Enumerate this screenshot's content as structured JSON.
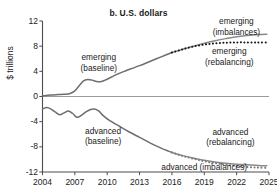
{
  "chart_data": {
    "type": "line",
    "title": "b. U.S. dollars",
    "xlabel": "",
    "ylabel": "$ trillions",
    "xlim": [
      2004,
      2025
    ],
    "ylim": [
      -12,
      12
    ],
    "grid": false,
    "legend_position": "inline-annotations",
    "xticks": [
      "2004",
      "2007",
      "2010",
      "2013",
      "2016",
      "2019",
      "2022",
      "2025"
    ],
    "xtick_values": [
      2004,
      2007,
      2010,
      2013,
      2016,
      2019,
      2022,
      2025
    ],
    "yticks": [
      "12",
      "8",
      "4",
      "0",
      "-4",
      "-8",
      "-12"
    ],
    "ytick_values": [
      12,
      8,
      4,
      0,
      -4,
      -8,
      -12
    ],
    "zero_line": 0,
    "annotations": [
      {
        "name": "emerging-baseline",
        "text_lines": [
          "emerging",
          "(baseline)"
        ],
        "x": 2009.2,
        "y": 5.4
      },
      {
        "name": "emerging-imbalances",
        "text_lines": [
          "emerging",
          "(imbalances)"
        ],
        "x": 2022.0,
        "y": 11.1
      },
      {
        "name": "emerging-rebalancing",
        "text_lines": [
          "emerging",
          "(rebalancing)"
        ],
        "x": 2021.3,
        "y": 6.3
      },
      {
        "name": "advanced-baseline",
        "text_lines": [
          "advanced",
          "(baseline)"
        ],
        "x": 2009.6,
        "y": -6.3
      },
      {
        "name": "advanced-rebalancing",
        "text_lines": [
          "advanced",
          "(rebalancing)"
        ],
        "x": 2021.4,
        "y": -6.5
      },
      {
        "name": "advanced-imbalances",
        "text_lines": [
          "advanced (imbalances)"
        ],
        "x": 2019.0,
        "y": -11.3
      }
    ],
    "series": [
      {
        "name": "emerging (baseline)",
        "style": "solid",
        "color": "#6e6e6e",
        "x": [
          2004,
          2004.5,
          2005,
          2005.5,
          2006,
          2006.5,
          2007,
          2007.4,
          2007.8,
          2008.2,
          2008.6,
          2009,
          2009.4,
          2009.8,
          2010.4,
          2011,
          2011.6,
          2012.2,
          2013,
          2014,
          2015,
          2016
        ],
        "values": [
          0.1,
          0.2,
          0.25,
          0.3,
          0.35,
          0.45,
          0.9,
          1.7,
          2.5,
          2.7,
          2.6,
          2.4,
          2.35,
          2.6,
          3.1,
          3.6,
          4.0,
          4.4,
          4.9,
          5.6,
          6.3,
          7.0
        ]
      },
      {
        "name": "emerging (imbalances)",
        "style": "solid",
        "color": "#8a8a8a",
        "x": [
          2016,
          2017,
          2018,
          2019,
          2020,
          2021,
          2022,
          2023,
          2024,
          2024.8
        ],
        "values": [
          7.0,
          7.5,
          8.0,
          8.45,
          8.85,
          9.2,
          9.5,
          9.7,
          9.85,
          9.9
        ]
      },
      {
        "name": "emerging (rebalancing)",
        "style": "dotted",
        "color": "#1a1a1a",
        "x": [
          2016,
          2017,
          2018,
          2019,
          2020,
          2021,
          2022,
          2023,
          2024,
          2024.8
        ],
        "values": [
          7.0,
          7.5,
          7.95,
          8.25,
          8.45,
          8.55,
          8.6,
          8.6,
          8.6,
          8.6
        ]
      },
      {
        "name": "advanced (baseline)",
        "style": "solid",
        "color": "#6e6e6e",
        "x": [
          2004,
          2004.4,
          2004.8,
          2005.2,
          2005.6,
          2006,
          2006.4,
          2006.8,
          2007.2,
          2007.6,
          2008,
          2008.4,
          2008.8,
          2009.2,
          2009.6,
          2010.2,
          2011,
          2012,
          2013,
          2014,
          2015,
          2016
        ],
        "values": [
          -2.0,
          -1.75,
          -2.0,
          -2.5,
          -2.9,
          -2.6,
          -2.3,
          -2.7,
          -3.3,
          -3.0,
          -2.5,
          -2.1,
          -2.0,
          -2.3,
          -3.0,
          -3.8,
          -4.6,
          -5.6,
          -6.5,
          -7.4,
          -8.2,
          -8.9
        ]
      },
      {
        "name": "advanced (rebalancing)",
        "style": "solid",
        "color": "#8a8a8a",
        "x": [
          2016,
          2017,
          2018,
          2019,
          2020,
          2021,
          2022,
          2023,
          2024,
          2024.8
        ],
        "values": [
          -8.9,
          -9.4,
          -9.8,
          -10.15,
          -10.4,
          -10.6,
          -10.75,
          -10.85,
          -10.95,
          -11.0
        ]
      },
      {
        "name": "advanced (imbalances)",
        "style": "dotted",
        "color": "#7a7a7a",
        "x": [
          2016,
          2017,
          2018,
          2019,
          2020,
          2021,
          2022,
          2023,
          2024,
          2024.8
        ],
        "values": [
          -8.9,
          -9.45,
          -9.9,
          -10.3,
          -10.6,
          -10.85,
          -11.05,
          -11.2,
          -11.3,
          -11.35
        ]
      }
    ]
  },
  "colors": {
    "axis": "#4d4d4d",
    "text": "#1a1a1a",
    "baseline_gray": "#6e6e6e",
    "imbalances_gray": "#8a8a8a",
    "rebalancing_black": "#1a1a1a"
  }
}
